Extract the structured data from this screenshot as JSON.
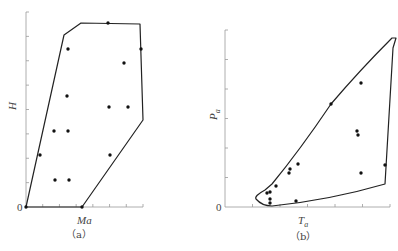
{
  "chart_data": [
    {
      "type": "scatter",
      "panel": "(a)",
      "title": "",
      "xlabel": "Ma",
      "ylabel": "H",
      "origin_label": "0",
      "x_ticks_count": 7,
      "y_ticks_count": 8,
      "grid": false,
      "points_px": [
        [
          26,
          207
        ],
        [
          108,
          23
        ],
        [
          68,
          49
        ],
        [
          141,
          49
        ],
        [
          124,
          63
        ],
        [
          67,
          96
        ],
        [
          109,
          107
        ],
        [
          128,
          107
        ],
        [
          54,
          131
        ],
        [
          68,
          131
        ],
        [
          40,
          155
        ],
        [
          110,
          155
        ],
        [
          55,
          180
        ],
        [
          69,
          180
        ],
        [
          82,
          207
        ]
      ],
      "boundary_px": [
        [
          26,
          207
        ],
        [
          64,
          35
        ],
        [
          81,
          23
        ],
        [
          140,
          24
        ],
        [
          143,
          120
        ],
        [
          82,
          207
        ]
      ]
    },
    {
      "type": "scatter",
      "panel": "(b)",
      "title": "",
      "xlabel": "T_a",
      "ylabel": "P_a",
      "origin_label": "0",
      "x_ticks_count": 6,
      "y_ticks_count": 6,
      "grid": false,
      "points_px": [
        [
          267,
          193
        ],
        [
          270,
          192
        ],
        [
          270,
          199
        ],
        [
          270,
          203
        ],
        [
          276,
          186
        ],
        [
          289,
          173
        ],
        [
          290,
          169
        ],
        [
          298,
          164
        ],
        [
          296,
          201
        ],
        [
          331,
          104
        ],
        [
          361,
          83
        ],
        [
          357,
          131
        ],
        [
          358,
          135
        ],
        [
          361,
          173
        ],
        [
          385,
          165
        ]
      ],
      "boundary_path": "M256,199 Q254,196 265,190 L272,184 Q300,150 331,104 Q360,70 392,38 L396,38 L393,48 L385,184 Q330,200 272,206 Q262,206 256,199 Z"
    }
  ],
  "labels": {
    "a_x": "Ma",
    "a_y": "H",
    "a_zero": "0",
    "a_caption": "（a）",
    "b_x": "T",
    "b_x_sub": "a",
    "b_y": "P",
    "b_y_sub": "a",
    "b_zero": "0",
    "b_caption": "（b）"
  }
}
